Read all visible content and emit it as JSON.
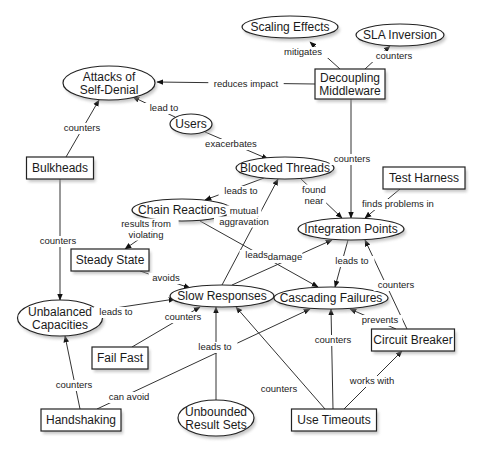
{
  "diagram": {
    "type": "concept-map",
    "nodes": [
      {
        "id": "scaling",
        "label": [
          "Scaling Effects"
        ],
        "shape": "ellipse",
        "cx": 290,
        "cy": 27,
        "w": 96,
        "h": 22
      },
      {
        "id": "sla",
        "label": [
          "SLA Inversion"
        ],
        "shape": "ellipse",
        "cx": 400,
        "cy": 35,
        "w": 88,
        "h": 22
      },
      {
        "id": "attacks",
        "label": [
          "Attacks of",
          "Self-Denial"
        ],
        "shape": "ellipse",
        "cx": 109,
        "cy": 83,
        "w": 92,
        "h": 34
      },
      {
        "id": "decoupling",
        "label": [
          "Decoupling",
          "Middleware"
        ],
        "shape": "box",
        "cx": 350,
        "cy": 84,
        "w": 70,
        "h": 30
      },
      {
        "id": "users",
        "label": [
          "Users"
        ],
        "shape": "ellipse",
        "cx": 191,
        "cy": 124,
        "w": 42,
        "h": 20
      },
      {
        "id": "bulkheads",
        "label": [
          "Bulkheads"
        ],
        "shape": "box",
        "cx": 60,
        "cy": 168,
        "w": 67,
        "h": 22
      },
      {
        "id": "blocked",
        "label": [
          "Blocked Threads"
        ],
        "shape": "ellipse",
        "cx": 285,
        "cy": 168,
        "w": 98,
        "h": 22
      },
      {
        "id": "testharness",
        "label": [
          "Test Harness"
        ],
        "shape": "box",
        "cx": 424,
        "cy": 178,
        "w": 82,
        "h": 22
      },
      {
        "id": "chain",
        "label": [
          "Chain Reactions"
        ],
        "shape": "ellipse",
        "cx": 182,
        "cy": 210,
        "w": 100,
        "h": 22
      },
      {
        "id": "integration",
        "label": [
          "Integration Points"
        ],
        "shape": "ellipse",
        "cx": 351,
        "cy": 229,
        "w": 106,
        "h": 22
      },
      {
        "id": "steady",
        "label": [
          "Steady State"
        ],
        "shape": "box",
        "cx": 110,
        "cy": 260,
        "w": 78,
        "h": 22
      },
      {
        "id": "slow",
        "label": [
          "Slow Responses"
        ],
        "shape": "ellipse",
        "cx": 222,
        "cy": 296,
        "w": 104,
        "h": 22
      },
      {
        "id": "cascading",
        "label": [
          "Cascading Failures"
        ],
        "shape": "ellipse",
        "cx": 331,
        "cy": 298,
        "w": 114,
        "h": 22
      },
      {
        "id": "unbalanced",
        "label": [
          "Unbalanced",
          "Capacities"
        ],
        "shape": "ellipse",
        "cx": 60,
        "cy": 318,
        "w": 85,
        "h": 36
      },
      {
        "id": "failfast",
        "label": [
          "Fail Fast"
        ],
        "shape": "box",
        "cx": 120,
        "cy": 358,
        "w": 56,
        "h": 22
      },
      {
        "id": "circuit",
        "label": [
          "Circuit Breaker"
        ],
        "shape": "box",
        "cx": 413,
        "cy": 340,
        "w": 83,
        "h": 22
      },
      {
        "id": "handshaking",
        "label": [
          "Handshaking"
        ],
        "shape": "box",
        "cx": 81,
        "cy": 420,
        "w": 80,
        "h": 22
      },
      {
        "id": "unbounded",
        "label": [
          "Unbounded",
          "Result Sets"
        ],
        "shape": "ellipse",
        "cx": 216,
        "cy": 418,
        "w": 76,
        "h": 36
      },
      {
        "id": "timeouts",
        "label": [
          "Use Timeouts"
        ],
        "shape": "box",
        "cx": 334,
        "cy": 420,
        "w": 85,
        "h": 22
      }
    ],
    "edges": [
      {
        "from": "decoupling",
        "to": "scaling",
        "label": [
          "mitigates"
        ],
        "pts": [
          [
            340,
            69
          ],
          [
            310,
            42
          ]
        ],
        "lx": 303,
        "ly": 55
      },
      {
        "from": "decoupling",
        "to": "sla",
        "label": [
          "counters"
        ],
        "pts": [
          [
            365,
            69
          ],
          [
            390,
            46
          ]
        ],
        "lx": 394,
        "ly": 59
      },
      {
        "from": "decoupling",
        "to": "attacks",
        "label": [
          "reduces impact"
        ],
        "pts": [
          [
            315,
            84
          ],
          [
            157,
            82
          ]
        ],
        "lx": 246,
        "ly": 87
      },
      {
        "from": "users",
        "to": "attacks",
        "label": [
          "lead to"
        ],
        "pts": [
          [
            175,
            117
          ],
          [
            133,
            97
          ]
        ],
        "lx": 164,
        "ly": 111
      },
      {
        "from": "bulkheads",
        "to": "attacks",
        "label": [
          "counters"
        ],
        "pts": [
          [
            66,
            157
          ],
          [
            99,
            100
          ]
        ],
        "lx": 82,
        "ly": 131
      },
      {
        "from": "users",
        "to": "blocked",
        "label": [
          "exacerbates"
        ],
        "pts": [
          [
            205,
            132
          ],
          [
            268,
            159
          ]
        ],
        "lx": 231,
        "ly": 147
      },
      {
        "from": "decoupling",
        "to": "integration",
        "label": [
          "counters"
        ],
        "pts": [
          [
            351,
            99
          ],
          [
            351,
            218
          ]
        ],
        "lx": 352,
        "ly": 162
      },
      {
        "from": "bulkheads",
        "to": "unbalanced",
        "label": [
          "counters"
        ],
        "pts": [
          [
            60,
            179
          ],
          [
            60,
            300
          ]
        ],
        "lx": 58,
        "ly": 244
      },
      {
        "from": "blocked",
        "to": "chain",
        "label": [
          "leads to"
        ],
        "pts": [
          [
            264,
            178
          ],
          [
            205,
            200
          ]
        ],
        "lx": 241,
        "ly": 194
      },
      {
        "from": "blocked",
        "to": "integration",
        "label": [
          "found",
          "near"
        ],
        "pts": [
          [
            300,
            178
          ],
          [
            342,
            218
          ]
        ],
        "lx": 314,
        "ly": 198
      },
      {
        "from": "testharness",
        "to": "integration",
        "label": [
          "finds problems in"
        ],
        "pts": [
          [
            400,
            189
          ],
          [
            365,
            218
          ]
        ],
        "lx": 398,
        "ly": 207
      },
      {
        "from": "slow",
        "to": "blocked",
        "label": [
          "mutual",
          "aggravation"
        ],
        "pts": [
          [
            222,
            285
          ],
          [
            278,
            179
          ]
        ],
        "lx": 244,
        "ly": 219
      },
      {
        "from": "chain",
        "to": "steady",
        "label": [
          "results from",
          "violating"
        ],
        "pts": [
          [
            165,
            221
          ],
          [
            125,
            249
          ]
        ],
        "lx": 146,
        "ly": 232
      },
      {
        "from": "chain",
        "to": "cascading",
        "label": [
          "leads to"
        ],
        "pts": [
          [
            200,
            221
          ],
          [
            318,
            287
          ]
        ],
        "lx": 262,
        "ly": 258
      },
      {
        "from": "slow",
        "to": "integration",
        "label": [
          "damage"
        ],
        "pts": [
          [
            232,
            285
          ],
          [
            332,
            240
          ]
        ],
        "lx": 285,
        "ly": 260
      },
      {
        "from": "integration",
        "to": "cascading",
        "label": [
          "leads to"
        ],
        "pts": [
          [
            348,
            240
          ],
          [
            335,
            287
          ]
        ],
        "lx": 352,
        "ly": 264
      },
      {
        "from": "steady",
        "to": "slow",
        "label": [
          "avoids"
        ],
        "pts": [
          [
            140,
            271
          ],
          [
            190,
            288
          ]
        ],
        "lx": 166,
        "ly": 281
      },
      {
        "from": "circuit",
        "to": "integration",
        "label": [
          "counters"
        ],
        "pts": [
          [
            407,
            329
          ],
          [
            365,
            240
          ]
        ],
        "lx": 396,
        "ly": 288
      },
      {
        "from": "circuit",
        "to": "cascading",
        "label": [
          "prevents"
        ],
        "pts": [
          [
            396,
            329
          ],
          [
            350,
            309
          ]
        ],
        "lx": 380,
        "ly": 323
      },
      {
        "from": "unbalanced",
        "to": "slow",
        "label": [
          "leads to"
        ],
        "pts": [
          [
            102,
            310
          ],
          [
            175,
            299
          ]
        ],
        "lx": 116,
        "ly": 315
      },
      {
        "from": "failfast",
        "to": "slow",
        "label": [
          "counters"
        ],
        "pts": [
          [
            132,
            347
          ],
          [
            200,
            307
          ]
        ],
        "lx": 183,
        "ly": 320
      },
      {
        "from": "handshaking",
        "to": "unbalanced",
        "label": [
          "counters"
        ],
        "pts": [
          [
            80,
            409
          ],
          [
            65,
            336
          ]
        ],
        "lx": 74,
        "ly": 388
      },
      {
        "from": "handshaking",
        "to": "cascading",
        "label": [
          "can avoid"
        ],
        "pts": [
          [
            97,
            409
          ],
          [
            310,
            309
          ]
        ],
        "lx": 129,
        "ly": 400
      },
      {
        "from": "unbounded",
        "to": "slow",
        "label": [
          "leads to"
        ],
        "pts": [
          [
            216,
            400
          ],
          [
            216,
            307
          ]
        ],
        "lx": 215,
        "ly": 350
      },
      {
        "from": "timeouts",
        "to": "slow",
        "label": [
          "counters"
        ],
        "pts": [
          [
            325,
            409
          ],
          [
            236,
            307
          ]
        ],
        "lx": 279,
        "ly": 392
      },
      {
        "from": "timeouts",
        "to": "cascading",
        "label": [
          "counters"
        ],
        "pts": [
          [
            333,
            409
          ],
          [
            331,
            309
          ]
        ],
        "lx": 333,
        "ly": 343
      },
      {
        "from": "timeouts",
        "to": "circuit",
        "label": [
          "works with"
        ],
        "pts": [
          [
            344,
            409
          ],
          [
            402,
            351
          ]
        ],
        "lx": 372,
        "ly": 384
      }
    ]
  }
}
